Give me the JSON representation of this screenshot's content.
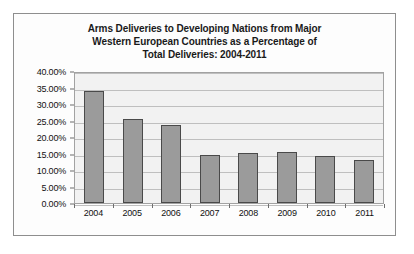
{
  "chart_data": {
    "type": "bar",
    "title": "Arms Deliveries to Developing Nations from Major Western European Countries as a Percentage of Total Deliveries: 2004-2011",
    "title_lines": [
      "Arms Deliveries to Developing Nations from Major",
      "Western European Countries as a Percentage of",
      "Total Deliveries: 2004-2011"
    ],
    "xlabel": "",
    "ylabel": "",
    "categories": [
      "2004",
      "2005",
      "2006",
      "2007",
      "2008",
      "2009",
      "2010",
      "2011"
    ],
    "values": [
      33.8,
      25.6,
      23.5,
      14.7,
      15.3,
      15.4,
      14.2,
      13.1
    ],
    "ylim": [
      0,
      40
    ],
    "ytick_values": [
      0,
      5,
      10,
      15,
      20,
      25,
      30,
      35,
      40
    ],
    "ytick_labels": [
      "0.00%",
      "5.00%",
      "10.00%",
      "15.00%",
      "20.00%",
      "25.00%",
      "30.00%",
      "35.00%",
      "40.00%"
    ],
    "grid": true,
    "legend": null,
    "bar_color": "#9b9b9b",
    "bar_border_color": "#4a4a4a",
    "plot_background": "#f2f2f2",
    "gridline_color": "#bfbfbf",
    "figure_border_color": "#8e8e8e"
  }
}
